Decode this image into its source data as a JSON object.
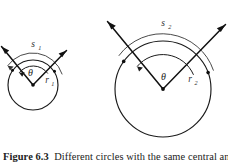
{
  "figure": {
    "caption_label": "Figure 6.3",
    "caption_text": "Different circles with the same central an",
    "caption_full_visible": "Figure 6.3  Different circles with the same central an",
    "background_color": "#ffffff",
    "line_color": "#1a1a1a",
    "label_color": "#2e2e2e"
  },
  "diagram": {
    "type": "geometry-diagram",
    "circles": [
      {
        "id": "small-circle",
        "center_x": 33,
        "center_y": 85,
        "radius": 25,
        "radius_label": "r",
        "radius_subscript": "1",
        "arc_label": "s",
        "arc_subscript": "1",
        "angle_label": "θ",
        "angle_degrees": 125,
        "ray_start_degrees": 20,
        "ray_end_degrees": 145
      },
      {
        "id": "large-circle",
        "center_x": 163,
        "center_y": 89,
        "radius": 48,
        "radius_label": "r",
        "radius_subscript": "2",
        "arc_label": "s",
        "arc_subscript": "2",
        "angle_label": "θ",
        "angle_degrees": 125,
        "ray_start_degrees": 20,
        "ray_end_degrees": 145
      }
    ],
    "labels": {
      "s1": "s",
      "s1_sub": "1",
      "r1": "r",
      "r1_sub": "1",
      "theta1": "θ",
      "s2": "s",
      "s2_sub": "2",
      "r2": "r",
      "r2_sub": "2",
      "theta2": "θ"
    }
  }
}
